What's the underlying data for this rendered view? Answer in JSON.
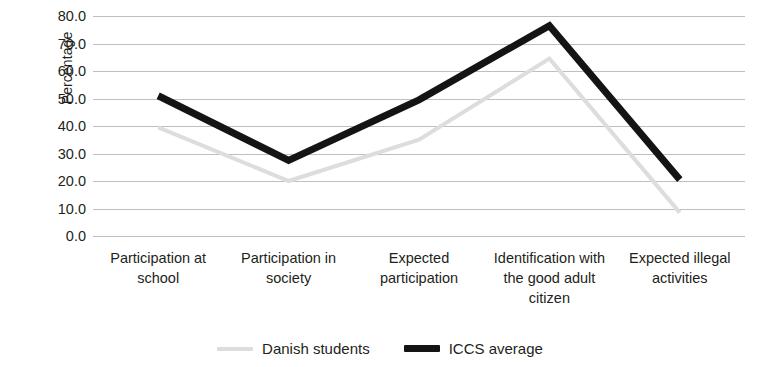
{
  "chart_data": {
    "type": "line",
    "title": "",
    "subtitle": "",
    "xlabel": "",
    "ylabel": "Percentage",
    "ylim": [
      0,
      80
    ],
    "ytick_step": 10,
    "grid": true,
    "legend_position": "bottom",
    "categories": [
      "Participation at school",
      "Participation in society",
      "Expected participation",
      "Identification with the good adult citizen",
      "Expected illegal activities"
    ],
    "ytick_labels": [
      "80.0",
      "70.0",
      "60.0",
      "50.0",
      "40.0",
      "30.0",
      "20.0",
      "10.0",
      "0.0"
    ],
    "ytick_values": [
      80,
      70,
      60,
      50,
      40,
      30,
      20,
      10,
      0
    ],
    "series": [
      {
        "name": "Danish students",
        "color": "#dddddd",
        "width": 4,
        "values": [
          39.5,
          20.0,
          35.0,
          64.5,
          8.5
        ]
      },
      {
        "name": "ICCS average",
        "color": "#141414",
        "width": 7,
        "values": [
          51.0,
          27.5,
          49.5,
          76.5,
          20.5
        ]
      }
    ]
  },
  "legend": {
    "entries": [
      {
        "label": "Danish students"
      },
      {
        "label": "ICCS average"
      }
    ]
  },
  "colors": {
    "danish_students": "#dddddd",
    "iccs_average": "#141414",
    "gridline": "#bfbfbf",
    "text": "#231f20",
    "background": "#ffffff"
  }
}
